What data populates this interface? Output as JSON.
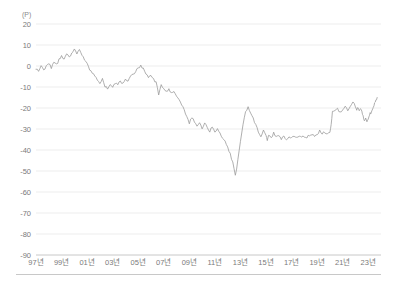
{
  "chart_data": {
    "type": "line",
    "title": "",
    "subtitle": "",
    "unit_label": "(P)",
    "xlabel": "",
    "ylabel": "",
    "ylim": [
      -90,
      20
    ],
    "xlim": [
      1997,
      2024
    ],
    "grid": true,
    "legend": null,
    "y_ticks": [
      20,
      10,
      0,
      -10,
      -20,
      -30,
      -40,
      -50,
      -60,
      -70,
      -80,
      -90
    ],
    "y_tick_labels": [
      "20",
      "10",
      "0",
      "-10",
      "-20",
      "-30",
      "-40",
      "-50",
      "-60",
      "-70",
      "-80",
      "-90"
    ],
    "x_ticks": [
      1997,
      1999,
      2001,
      2003,
      2005,
      2007,
      2009,
      2011,
      2013,
      2015,
      2017,
      2019,
      2021,
      2023
    ],
    "x_tick_labels": [
      "97년",
      "99년",
      "01년",
      "03년",
      "05년",
      "07년",
      "09년",
      "11년",
      "13년",
      "15년",
      "17년",
      "19년",
      "21년",
      "23년"
    ],
    "series": [
      {
        "name": "지수",
        "color": "#9a9a9a",
        "x": [
          1997.0,
          1997.2,
          1997.4,
          1997.6,
          1997.8,
          1998.0,
          1998.2,
          1998.4,
          1998.6,
          1998.8,
          1999.0,
          1999.2,
          1999.4,
          1999.6,
          1999.8,
          2000.0,
          2000.2,
          2000.4,
          2000.6,
          2000.8,
          2001.0,
          2001.2,
          2001.4,
          2001.6,
          2001.8,
          2002.0,
          2002.2,
          2002.4,
          2002.6,
          2002.8,
          2003.0,
          2003.2,
          2003.4,
          2003.6,
          2003.8,
          2004.0,
          2004.2,
          2004.4,
          2004.6,
          2004.8,
          2005.0,
          2005.2,
          2005.4,
          2005.6,
          2005.8,
          2006.0,
          2006.2,
          2006.4,
          2006.6,
          2006.8,
          2007.0,
          2007.2,
          2007.4,
          2007.6,
          2007.8,
          2008.0,
          2008.2,
          2008.4,
          2008.6,
          2008.8,
          2009.0,
          2009.2,
          2009.4,
          2009.6,
          2009.8,
          2010.0,
          2010.2,
          2010.4,
          2010.6,
          2010.8,
          2011.0,
          2011.2,
          2011.4,
          2011.6,
          2011.8,
          2012.0,
          2012.2,
          2012.4,
          2012.6,
          2012.8,
          2013.0,
          2013.2,
          2013.4,
          2013.6,
          2013.8,
          2014.0,
          2014.2,
          2014.4,
          2014.6,
          2014.8,
          2015.0,
          2015.1,
          2015.2,
          2015.4,
          2015.6,
          2015.8,
          2016.0,
          2016.2,
          2016.4,
          2016.6,
          2016.8,
          2017.0,
          2017.2,
          2017.4,
          2017.6,
          2017.8,
          2018.0,
          2018.2,
          2018.4,
          2018.6,
          2018.8,
          2019.0,
          2019.2,
          2019.4,
          2019.6,
          2019.8,
          2020.0,
          2020.1,
          2020.2,
          2020.4,
          2020.6,
          2020.8,
          2021.0,
          2021.2,
          2021.4,
          2021.6,
          2021.8,
          2022.0,
          2022.1,
          2022.2,
          2022.3,
          2022.4,
          2022.5,
          2022.6,
          2022.7,
          2022.8,
          2022.9,
          2023.0,
          2023.1,
          2023.2,
          2023.3,
          2023.4,
          2023.5,
          2023.6,
          2023.7
        ],
        "y": [
          -1.0,
          -3.0,
          0.5,
          -2.0,
          0.0,
          1.5,
          -1.0,
          2.0,
          0.5,
          3.0,
          4.5,
          3.0,
          5.5,
          4.0,
          6.5,
          8.0,
          6.0,
          7.5,
          5.0,
          3.0,
          1.0,
          -1.5,
          -3.0,
          -5.0,
          -6.5,
          -8.0,
          -6.0,
          -9.5,
          -11.0,
          -9.0,
          -10.5,
          -8.0,
          -9.0,
          -7.0,
          -8.5,
          -6.0,
          -7.5,
          -5.0,
          -4.0,
          -2.5,
          -1.0,
          0.0,
          -1.5,
          -3.5,
          -5.0,
          -4.0,
          -6.5,
          -8.0,
          -13.5,
          -9.0,
          -10.5,
          -12.0,
          -11.0,
          -13.0,
          -12.0,
          -14.5,
          -16.0,
          -18.5,
          -21.0,
          -24.0,
          -27.0,
          -24.5,
          -26.5,
          -29.0,
          -27.5,
          -29.5,
          -27.0,
          -29.0,
          -31.0,
          -29.0,
          -31.5,
          -29.5,
          -32.0,
          -34.0,
          -36.0,
          -39.0,
          -42.0,
          -46.0,
          -52.5,
          -45.0,
          -36.0,
          -28.0,
          -22.0,
          -19.5,
          -22.5,
          -25.0,
          -28.0,
          -31.0,
          -33.5,
          -31.0,
          -33.0,
          -35.0,
          -32.5,
          -34.5,
          -32.0,
          -34.0,
          -33.0,
          -35.0,
          -33.5,
          -35.0,
          -34.0,
          -34.5,
          -33.0,
          -34.5,
          -33.5,
          -34.0,
          -33.5,
          -34.0,
          -33.0,
          -32.5,
          -33.5,
          -32.5,
          -31.0,
          -32.0,
          -31.5,
          -32.0,
          -31.5,
          -28.0,
          -22.0,
          -21.5,
          -20.5,
          -22.0,
          -21.0,
          -19.5,
          -21.0,
          -19.0,
          -17.5,
          -19.0,
          -21.0,
          -19.5,
          -21.5,
          -20.0,
          -22.0,
          -24.0,
          -26.0,
          -24.5,
          -26.5,
          -25.0,
          -23.0,
          -22.5,
          -21.0,
          -19.5,
          -18.0,
          -16.5,
          -15.0
        ]
      }
    ],
    "annotations": []
  },
  "footer": {
    "caption": ""
  }
}
